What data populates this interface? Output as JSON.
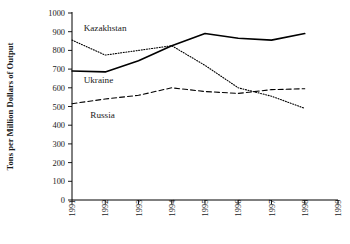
{
  "chart_data": {
    "type": "line",
    "title": "",
    "subtitle": "",
    "xlabel": "",
    "ylabel": "Tons per Million Dollars of Output",
    "xlim": [
      1991,
      1999
    ],
    "ylim": [
      0,
      1000
    ],
    "grid": false,
    "legend_position": "inline-annotations",
    "x": [
      1991,
      1992,
      1993,
      1994,
      1995,
      1996,
      1997,
      1998,
      1999
    ],
    "xtick_labels": [
      "1991",
      "1992",
      "1993",
      "1994",
      "1995",
      "1996",
      "1997",
      "1998",
      "1999"
    ],
    "ytick_values": [
      0,
      100,
      200,
      300,
      400,
      500,
      600,
      700,
      800,
      900,
      1000
    ],
    "ytick_labels": [
      "0",
      "100",
      "200",
      "300",
      "400",
      "500",
      "600",
      "700",
      "800",
      "900",
      "1000"
    ],
    "series": [
      {
        "name": "Kazakhstan",
        "style": "dotted",
        "color": "#000000",
        "x": [
          1991,
          1992,
          1993,
          1994,
          1995,
          1996,
          1997,
          1998
        ],
        "values": [
          855,
          775,
          800,
          825,
          720,
          600,
          555,
          490
        ]
      },
      {
        "name": "Ukraine",
        "style": "solid",
        "color": "#000000",
        "x": [
          1991,
          1992,
          1993,
          1994,
          1995,
          1996,
          1997,
          1998
        ],
        "values": [
          690,
          685,
          745,
          825,
          890,
          865,
          855,
          890
        ]
      },
      {
        "name": "Russia",
        "style": "dashed",
        "color": "#000000",
        "x": [
          1991,
          1992,
          1993,
          1994,
          1995,
          1996,
          1997,
          1998
        ],
        "values": [
          515,
          540,
          560,
          600,
          580,
          570,
          590,
          595
        ]
      }
    ],
    "annotations": [
      {
        "text": "Kazakhstan",
        "x": 1991.35,
        "y": 905
      },
      {
        "text": "Ukraine",
        "x": 1991.35,
        "y": 625
      },
      {
        "text": "Russia",
        "x": 1991.55,
        "y": 440
      }
    ]
  }
}
